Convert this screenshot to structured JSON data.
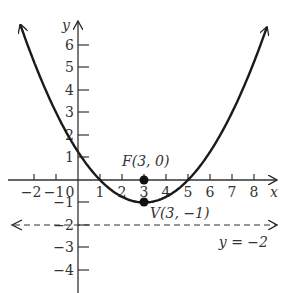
{
  "diagram": {
    "type": "parabola-graph",
    "equation": "(x-3)^2 = 4(y+1)",
    "axes": {
      "x_label": "x",
      "y_label": "y",
      "x_ticks": [
        "−2",
        "−1",
        "0",
        "1",
        "2",
        "3",
        "4",
        "5",
        "6",
        "7",
        "8"
      ],
      "y_ticks": [
        "6",
        "5",
        "4",
        "3",
        "2",
        "1",
        "−1",
        "−2",
        "−3",
        "−4"
      ]
    },
    "points": {
      "focus": {
        "label": "F(3, 0)",
        "x": 3,
        "y": 0
      },
      "vertex": {
        "label": "V(3, −1)",
        "x": 3,
        "y": -1
      }
    },
    "directrix": {
      "label": "y = −2",
      "y": -2
    }
  }
}
